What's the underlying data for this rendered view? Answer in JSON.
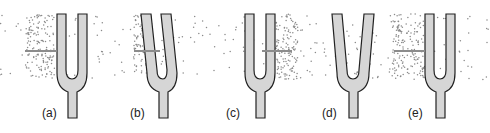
{
  "figure": {
    "colors": {
      "fork_fill": "#d6d6d6",
      "fork_outline": "#222222",
      "dots": "#8a8a8a",
      "arrow": "#8c8c8c",
      "label": "#222222"
    },
    "panels": [
      {
        "label": "(a)",
        "prong_state": "neutral",
        "compression_side": "left",
        "arrow": "right-into-left-prong"
      },
      {
        "label": "(b)",
        "prong_state": "bent-left",
        "compression_side": "left",
        "arrow": "right-into-left-prong"
      },
      {
        "label": "(c)",
        "prong_state": "neutral",
        "compression_side": "right",
        "arrow": "right-from-right-prong"
      },
      {
        "label": "(d)",
        "prong_state": "splayed-outward",
        "compression_side": "none",
        "arrow": "none"
      },
      {
        "label": "(e)",
        "prong_state": "neutral",
        "compression_side": "left",
        "arrow": "right-into-left-prong"
      }
    ]
  }
}
